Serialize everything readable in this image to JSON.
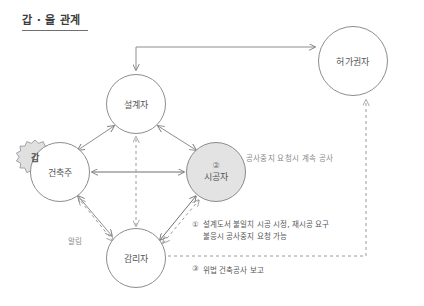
{
  "title": {
    "text": "갑 · 을 관계"
  },
  "colors": {
    "line": "#8d8d8d",
    "dashed": "#9a9a9a",
    "node_fill": "#ffffff",
    "node_shaded_fill": "#e3e3e3",
    "text": "#565656",
    "muted_text": "#8a8a8a"
  },
  "nodes": [
    {
      "id": "designer",
      "label": "설계자"
    },
    {
      "id": "owner",
      "label": "건축주"
    },
    {
      "id": "builder",
      "label": "시공자",
      "badge": "②"
    },
    {
      "id": "supervisor",
      "label": "감리자"
    },
    {
      "id": "authority",
      "label": "허가권자"
    }
  ],
  "badges": {
    "owner_starburst": "갑"
  },
  "annotations": {
    "continue_work": "공사중지 요청시 계속 공사",
    "notify": "알림",
    "note1_marker": "①",
    "note1_line1": "설계도서 불일치 시공 시정, 재시공 요구",
    "note1_line2": "불응시 공사중지 요청 가능",
    "note3_marker": "③",
    "note3_text": "위법 건축공사 보고"
  }
}
